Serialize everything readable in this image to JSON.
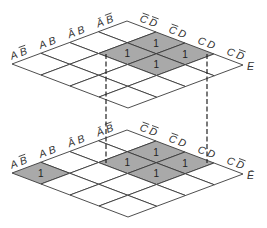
{
  "row_labels": [
    "A B̄",
    "A B",
    "Ā B",
    "Ā B̄"
  ],
  "col_labels": [
    "C̄ D̄",
    "C̄ D",
    "C D",
    "C D̄"
  ],
  "maps": [
    {
      "name": "E",
      "layer_label": "E",
      "ones": [
        {
          "row": "Ā B̄",
          "col": "C̄ D",
          "value": "1"
        },
        {
          "row": "Ā B",
          "col": "C̄ D",
          "value": "1"
        },
        {
          "row": "Ā B̄",
          "col": "C D",
          "value": "1"
        },
        {
          "row": "Ā B",
          "col": "C D",
          "value": "1"
        }
      ]
    },
    {
      "name": "E-bar",
      "layer_label": "Ē",
      "ones": [
        {
          "row": "Ā B̄",
          "col": "C̄ D",
          "value": "1"
        },
        {
          "row": "Ā B",
          "col": "C̄ D",
          "value": "1"
        },
        {
          "row": "Ā B̄",
          "col": "C D",
          "value": "1"
        },
        {
          "row": "Ā B",
          "col": "C D",
          "value": "1"
        },
        {
          "row": "A B̄",
          "col": "C̄ D̄",
          "value": "1"
        }
      ]
    }
  ],
  "colors": {
    "shaded": "#a9a9a9",
    "line": "#3a3a3a",
    "background": "#ffffff"
  },
  "connectors": "dashed vertical lines linking the shaded 2x2 group between the E and Ē maps"
}
